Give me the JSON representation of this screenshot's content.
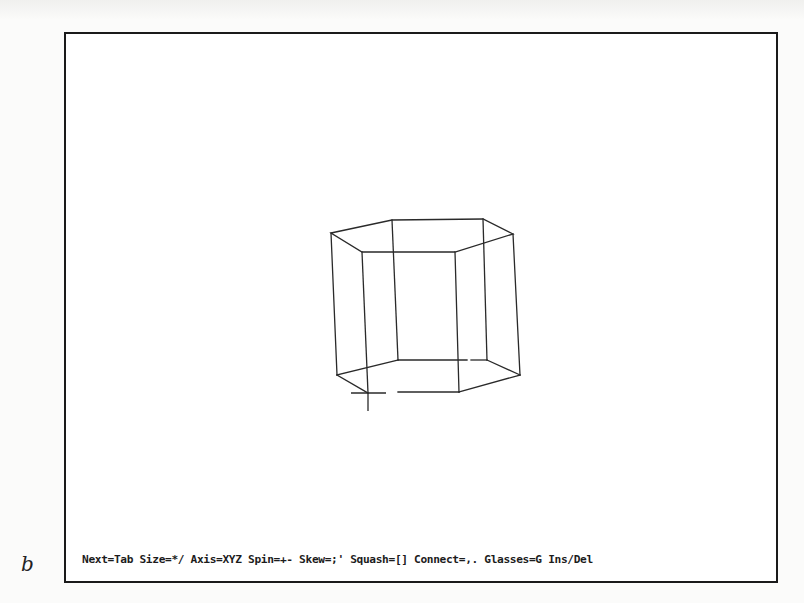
{
  "figure": {
    "label": "b"
  },
  "screen": {
    "status_bar": {
      "text": "Next=Tab Size=*/ Axis=XYZ Spin=+- Skew=;' Squash=[] Connect=,. Glasses=G Ins/Del",
      "items": [
        {
          "action": "Next",
          "key": "Tab"
        },
        {
          "action": "Size",
          "key": "*/"
        },
        {
          "action": "Axis",
          "key": "XYZ"
        },
        {
          "action": "Spin",
          "key": "+-"
        },
        {
          "action": "Skew",
          "key": ";'"
        },
        {
          "action": "Squash",
          "key": "[]"
        },
        {
          "action": "Connect",
          "key": ",."
        },
        {
          "action": "Glasses",
          "key": "G"
        },
        {
          "action": "Ins/Del",
          "key": ""
        }
      ]
    },
    "wireframe": {
      "shape": "hexagonal-prism",
      "stroke_color": "#2a2a2a",
      "top_vertices": [
        [
          331,
          233
        ],
        [
          392,
          220
        ],
        [
          483,
          219
        ],
        [
          513,
          234
        ],
        [
          455,
          252
        ],
        [
          362,
          252
        ]
      ],
      "bottom_vertices": [
        [
          337,
          375
        ],
        [
          398,
          360
        ],
        [
          487,
          360
        ],
        [
          520,
          375
        ],
        [
          459,
          392
        ],
        [
          368,
          393
        ]
      ]
    },
    "cursor": {
      "type": "crosshair",
      "x": 367,
      "y": 393
    }
  }
}
